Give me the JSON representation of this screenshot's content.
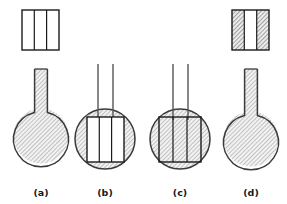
{
  "figure": {
    "type": "scientific-diagram",
    "background_color": "#ffffff",
    "outline_color": "#1a1a1a",
    "hatch_color": "#8c8c8c",
    "hatch_background": "#f0f0f0",
    "panels": [
      {
        "id": "a",
        "label": "(a)",
        "label_x": 41,
        "label_y": 196,
        "flask": {
          "circle_cx": 41,
          "circle_cy": 136,
          "circle_r": 27,
          "fill": "hatched",
          "neck_style": "single-wide",
          "neck_x": 34,
          "neck_y": 68,
          "neck_w": 14,
          "neck_h": 48,
          "neck_fill": "hatched",
          "inner_rect": "none"
        },
        "top_rect": {
          "present": true,
          "x": 22,
          "y": 10,
          "w": 37,
          "h": 40,
          "columns": 3,
          "column_fills": [
            "white",
            "white",
            "white"
          ]
        }
      },
      {
        "id": "b",
        "label": "(b)",
        "label_x": 105,
        "label_y": 196,
        "flask": {
          "circle_cx": 105,
          "circle_cy": 139,
          "circle_r": 30,
          "fill": "hatched",
          "neck_style": "double-thin-tube",
          "tube_left_x": 98,
          "tube_right_x": 113,
          "tube_top_y": 64,
          "tube_bottom_y": 118,
          "inner_rect": {
            "x": 87,
            "y": 117,
            "w": 37,
            "h": 45,
            "columns": 3,
            "fill": "white"
          }
        },
        "top_rect": {
          "present": false
        }
      },
      {
        "id": "c",
        "label": "(c)",
        "label_x": 180,
        "label_y": 196,
        "flask": {
          "circle_cx": 180,
          "circle_cy": 139,
          "circle_r": 30,
          "fill": "hatched",
          "neck_style": "double-thin-tube",
          "tube_left_x": 173,
          "tube_right_x": 188,
          "tube_top_y": 64,
          "tube_bottom_y": 118,
          "inner_rect": {
            "x": 159,
            "y": 117,
            "w": 42,
            "h": 45,
            "columns": 3,
            "fill": "hatched"
          }
        },
        "top_rect": {
          "present": false
        }
      },
      {
        "id": "d",
        "label": "(d)",
        "label_x": 251,
        "label_y": 196,
        "flask": {
          "circle_cx": 251,
          "circle_cy": 139,
          "circle_r": 27,
          "fill": "hatched",
          "neck_style": "single-wide",
          "neck_x": 244,
          "neck_y": 68,
          "neck_w": 14,
          "neck_h": 48,
          "neck_fill": "hatched",
          "inner_rect": "none"
        },
        "top_rect": {
          "present": true,
          "x": 232,
          "y": 10,
          "w": 37,
          "h": 40,
          "columns": 3,
          "column_fills": [
            "hatched",
            "white",
            "hatched"
          ]
        }
      }
    ],
    "labels": {
      "a": "(a)",
      "b": "(b)",
      "c": "(c)",
      "d": "(d)"
    }
  }
}
